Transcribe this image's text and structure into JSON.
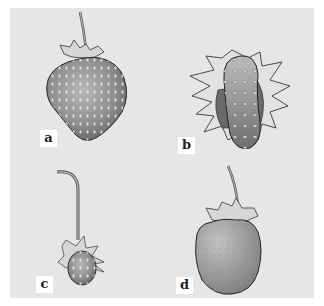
{
  "figure": {
    "background_color": "#e6e6e6",
    "panels": [
      {
        "id": "a",
        "label": "a",
        "description": "large irregular heart-shaped strawberry with stem and sepals"
      },
      {
        "id": "b",
        "label": "b",
        "description": "elongated strawberry surrounded by large spreading sepals"
      },
      {
        "id": "c",
        "label": "c",
        "description": "small strawberry hanging from long curved stem"
      },
      {
        "id": "d",
        "label": "d",
        "description": "rounded strawberry with upright stem and sepals"
      }
    ]
  }
}
